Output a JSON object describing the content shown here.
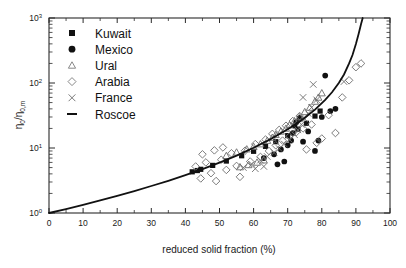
{
  "chart_data": {
    "type": "scatter",
    "title": "",
    "xlabel": "reduced solid fraction (%)",
    "ylabel": "η₀/η₀,m",
    "xlim": [
      0,
      100
    ],
    "ylim": [
      1,
      1000
    ],
    "yscale": "log",
    "xscale": "linear",
    "grid": false,
    "legend_position": "upper-left-inside",
    "xticks": [
      0,
      10,
      20,
      30,
      40,
      50,
      60,
      70,
      80,
      90,
      100
    ],
    "xtick_labels": [
      "0",
      "10",
      "20",
      "30",
      "40",
      "50",
      "60",
      "70",
      "80",
      "90",
      "100"
    ],
    "yticks": [
      1,
      10,
      100,
      1000
    ],
    "ytick_labels": [
      "10⁰",
      "10¹",
      "10²",
      "10³"
    ],
    "ytick_mantissa": [
      "10",
      "10",
      "10",
      "10"
    ],
    "ytick_exponent": [
      "0",
      "1",
      "2",
      "3"
    ],
    "legend": [
      {
        "name": "Kuwait",
        "marker": "filled-square",
        "color": "#111111"
      },
      {
        "name": "Mexico",
        "marker": "filled-circle",
        "color": "#111111"
      },
      {
        "name": "Ural",
        "marker": "open-triangle",
        "color": "#7a7a7a"
      },
      {
        "name": "Arabia",
        "marker": "open-diamond",
        "color": "#7a7a7a"
      },
      {
        "name": "France",
        "marker": "cross-x",
        "color": "#7a7a7a"
      },
      {
        "name": "Roscoe",
        "marker": "line",
        "color": "#111111"
      }
    ],
    "series": [
      {
        "name": "Kuwait",
        "marker": "filled-square",
        "points": [
          [
            42.0,
            4.3
          ],
          [
            43.5,
            4.5
          ],
          [
            44.5,
            4.7
          ],
          [
            48.0,
            5.4
          ],
          [
            52.0,
            6.3
          ],
          [
            56.5,
            7.6
          ],
          [
            60.0,
            8.9
          ],
          [
            63.5,
            10.6
          ],
          [
            66.5,
            12.5
          ],
          [
            70.0,
            15.5
          ],
          [
            73.0,
            19.5
          ],
          [
            75.5,
            24.0
          ],
          [
            78.0,
            31.0
          ],
          [
            79.5,
            37.0
          ]
        ]
      },
      {
        "name": "Mexico",
        "marker": "filled-circle",
        "points": [
          [
            63.0,
            7.0
          ],
          [
            66.0,
            8.0
          ],
          [
            68.0,
            9.5
          ],
          [
            70.0,
            11.0
          ],
          [
            71.0,
            13.0
          ],
          [
            71.5,
            17.0
          ],
          [
            72.0,
            22.0
          ],
          [
            72.5,
            25.0
          ],
          [
            73.5,
            29.0
          ],
          [
            74.5,
            12.5
          ],
          [
            76.0,
            18.0
          ],
          [
            78.0,
            9.0
          ],
          [
            79.0,
            13.0
          ],
          [
            80.0,
            30.0
          ],
          [
            81.0,
            130.0
          ],
          [
            82.5,
            37.0
          ],
          [
            84.0,
            40.0
          ],
          [
            69.0,
            6.2
          ],
          [
            67.0,
            5.6
          ]
        ]
      },
      {
        "name": "Ural",
        "marker": "open-triangle",
        "points": [
          [
            52.0,
            7.6
          ],
          [
            55.0,
            8.6
          ],
          [
            58.0,
            9.6
          ],
          [
            60.0,
            10.5
          ],
          [
            62.0,
            11.5
          ],
          [
            64.0,
            13.0
          ],
          [
            65.5,
            14.5
          ],
          [
            66.5,
            16.0
          ],
          [
            68.0,
            18.0
          ],
          [
            69.5,
            20.0
          ],
          [
            70.5,
            22.5
          ],
          [
            72.0,
            26.0
          ],
          [
            73.5,
            30.0
          ],
          [
            75.0,
            36.0
          ],
          [
            76.5,
            42.0
          ],
          [
            78.0,
            52.0
          ],
          [
            79.0,
            60.0
          ],
          [
            80.0,
            70.0
          ],
          [
            63.0,
            6.5
          ],
          [
            61.0,
            6.0
          ],
          [
            58.5,
            5.5
          ],
          [
            56.0,
            5.1
          ]
        ]
      },
      {
        "name": "Arabia",
        "marker": "open-diamond",
        "points": [
          [
            43.0,
            5.2
          ],
          [
            44.5,
            3.4
          ],
          [
            46.0,
            6.0
          ],
          [
            47.5,
            4.1
          ],
          [
            49.0,
            3.1
          ],
          [
            50.5,
            6.6
          ],
          [
            52.0,
            4.6
          ],
          [
            53.5,
            8.3
          ],
          [
            55.0,
            5.3
          ],
          [
            56.0,
            3.6
          ],
          [
            57.5,
            9.1
          ],
          [
            59.0,
            6.2
          ],
          [
            60.5,
            11.5
          ],
          [
            62.0,
            7.3
          ],
          [
            63.5,
            13.5
          ],
          [
            64.5,
            9.0
          ],
          [
            65.5,
            16.5
          ],
          [
            66.5,
            11.0
          ],
          [
            67.5,
            19.0
          ],
          [
            68.5,
            13.0
          ],
          [
            69.5,
            22.0
          ],
          [
            70.5,
            15.0
          ],
          [
            71.5,
            26.0
          ],
          [
            72.5,
            17.5
          ],
          [
            73.5,
            31.0
          ],
          [
            74.5,
            20.0
          ],
          [
            75.5,
            9.5
          ],
          [
            77.0,
            23.0
          ],
          [
            78.5,
            12.0
          ],
          [
            80.0,
            14.0
          ],
          [
            82.0,
            32.0
          ],
          [
            84.0,
            17.0
          ],
          [
            86.0,
            60.0
          ],
          [
            88.0,
            110.0
          ],
          [
            90.0,
            175.0
          ],
          [
            91.5,
            200.0
          ],
          [
            45.0,
            8.0
          ],
          [
            48.5,
            9.2
          ],
          [
            51.0,
            10.2
          ]
        ]
      },
      {
        "name": "France",
        "marker": "cross-x",
        "points": [
          [
            57.0,
            5.0
          ],
          [
            59.5,
            5.6
          ],
          [
            62.0,
            6.5
          ],
          [
            64.0,
            7.4
          ],
          [
            66.0,
            8.5
          ],
          [
            67.5,
            9.8
          ],
          [
            69.0,
            11.5
          ],
          [
            70.5,
            13.5
          ],
          [
            72.0,
            16.0
          ],
          [
            73.0,
            19.0
          ],
          [
            74.0,
            23.0
          ],
          [
            75.0,
            28.0
          ],
          [
            76.0,
            34.0
          ],
          [
            77.0,
            42.0
          ],
          [
            78.5,
            55.0
          ],
          [
            74.5,
            60.0
          ],
          [
            77.5,
            95.0
          ],
          [
            86.5,
            105.0
          ],
          [
            63.0,
            5.2
          ],
          [
            60.5,
            4.8
          ]
        ]
      }
    ],
    "model_curve": {
      "name": "Roscoe",
      "type": "line",
      "description": "Roscoe relation η₀/η₀,m = (1 - f/f_max)^-2.5",
      "points": [
        [
          0,
          1.0
        ],
        [
          5,
          1.15
        ],
        [
          10,
          1.33
        ],
        [
          15,
          1.56
        ],
        [
          20,
          1.83
        ],
        [
          25,
          2.17
        ],
        [
          30,
          2.6
        ],
        [
          35,
          3.13
        ],
        [
          40,
          3.82
        ],
        [
          45,
          4.72
        ],
        [
          50,
          5.95
        ],
        [
          55,
          7.64
        ],
        [
          60,
          10.1
        ],
        [
          65,
          13.7
        ],
        [
          70,
          19.4
        ],
        [
          74,
          26.5
        ],
        [
          78,
          39.0
        ],
        [
          81,
          55.0
        ],
        [
          83,
          72.0
        ],
        [
          85,
          100.0
        ],
        [
          86.5,
          135.0
        ],
        [
          88,
          200.0
        ],
        [
          89,
          270.0
        ],
        [
          90,
          400.0
        ],
        [
          90.8,
          570.0
        ],
        [
          91.5,
          800.0
        ],
        [
          92.0,
          1000.0
        ]
      ]
    }
  },
  "axes": {
    "x_axis_title": "reduced solid fraction (%)",
    "y_axis_title": "η₀/η₀,m"
  }
}
